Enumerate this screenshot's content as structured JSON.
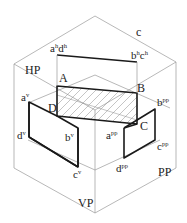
{
  "diagram": {
    "planes": {
      "hp": "HP",
      "vp": "VP",
      "pp": "PP"
    },
    "corner_label": "c",
    "object_vertices": {
      "a": "A",
      "b": "B",
      "c": "C",
      "d": "D"
    },
    "horizontal_projection": {
      "left_base": "a",
      "left_sup": "h",
      "left_base2": "d",
      "left_sup2": "h",
      "right_base": "b",
      "right_sup": "h",
      "right_base2": "c",
      "right_sup2": "h"
    },
    "vertical_projection": {
      "a_base": "a",
      "a_sup": "v",
      "b_base": "b",
      "b_sup": "v",
      "c_base": "c",
      "c_sup": "v",
      "d_base": "d",
      "d_sup": "v"
    },
    "profile_projection": {
      "a_base": "a",
      "a_sup": "pp",
      "b_base": "b",
      "b_sup": "pp",
      "c_base": "c",
      "c_sup": "pp",
      "d_base": "d",
      "d_sup": "pp"
    },
    "colors": {
      "thin_line": "#9a9a9a",
      "thick_line": "#1a1a1a",
      "hatch": "#8a8a8a",
      "background": "#ffffff"
    }
  }
}
